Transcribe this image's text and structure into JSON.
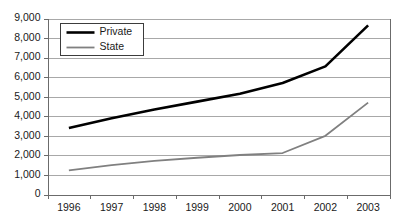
{
  "chart_data": {
    "type": "line",
    "title": "",
    "subtitle": "",
    "xlabel": "",
    "ylabel": "",
    "categories": [
      "1996",
      "1997",
      "1998",
      "1999",
      "2000",
      "2001",
      "2002",
      "2003"
    ],
    "series": [
      {
        "name": "Private",
        "color": "#000000",
        "stroke_width": 2.6,
        "values": [
          3400,
          3900,
          4350,
          4750,
          5150,
          5700,
          6550,
          8650
        ]
      },
      {
        "name": "State",
        "color": "#808080",
        "stroke_width": 1.8,
        "values": [
          1230,
          1500,
          1720,
          1880,
          2020,
          2120,
          3000,
          4700
        ]
      }
    ],
    "ylim": [
      0,
      9000
    ],
    "yticks": [
      0,
      1000,
      2000,
      3000,
      4000,
      5000,
      6000,
      7000,
      8000,
      9000
    ],
    "ytick_labels": [
      "0",
      "1,000",
      "2,000",
      "3,000",
      "4,000",
      "5,000",
      "6,000",
      "7,000",
      "8,000",
      "9,000"
    ],
    "grid": true,
    "grid_color": "#a8a8a8",
    "axis_color": "#6b6b6b",
    "plot_background": "#ffffff",
    "legend": {
      "position": "top-left-inside",
      "border_color": "#3c3c3c",
      "background": "#ffffff",
      "entries": [
        {
          "label": "Private",
          "color": "#000000",
          "stroke_width": 2.6
        },
        {
          "label": "State",
          "color": "#808080",
          "stroke_width": 1.8
        }
      ]
    }
  }
}
